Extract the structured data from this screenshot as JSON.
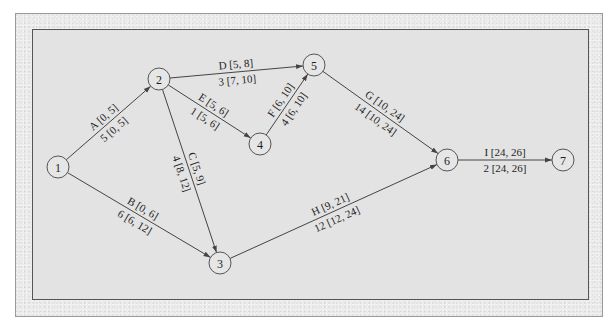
{
  "diagram": {
    "type": "project-network (activity-on-arc)",
    "colors": {
      "background": "#ffffff",
      "frame": "#ebebeb",
      "panel": "#e3e3e3",
      "line": "#444444",
      "text": "#1e1e1e"
    },
    "nodes": [
      {
        "id": "1",
        "label": "1",
        "x": 58,
        "y": 167
      },
      {
        "id": "2",
        "label": "2",
        "x": 159,
        "y": 79
      },
      {
        "id": "3",
        "label": "3",
        "x": 220,
        "y": 263
      },
      {
        "id": "4",
        "label": "4",
        "x": 260,
        "y": 144
      },
      {
        "id": "5",
        "label": "5",
        "x": 314,
        "y": 65
      },
      {
        "id": "6",
        "label": "6",
        "x": 447,
        "y": 160
      },
      {
        "id": "7",
        "label": "7",
        "x": 563,
        "y": 160
      }
    ],
    "edges": [
      {
        "activity": "A",
        "from": "1",
        "to": "2",
        "duration": "5",
        "top": "A  [0, 5]",
        "bottom": "5  [0, 5]"
      },
      {
        "activity": "B",
        "from": "1",
        "to": "3",
        "duration": "6",
        "top": "B  [0, 6]",
        "bottom": "6  [6, 12]"
      },
      {
        "activity": "C",
        "from": "2",
        "to": "3",
        "duration": "4",
        "top": "C  [5, 9]",
        "bottom": "4  [8, 12]"
      },
      {
        "activity": "D",
        "from": "2",
        "to": "5",
        "duration": "3",
        "top": "D  [5, 8]",
        "bottom": "3  [7, 10]"
      },
      {
        "activity": "E",
        "from": "2",
        "to": "4",
        "duration": "1",
        "top": "E  [5, 6]",
        "bottom": "1  [5, 6]"
      },
      {
        "activity": "F",
        "from": "4",
        "to": "5",
        "duration": "4",
        "top": "F  [6, 10]",
        "bottom": "4  [6, 10]"
      },
      {
        "activity": "G",
        "from": "5",
        "to": "6",
        "duration": "14",
        "top": "G  [10, 24]",
        "bottom": "14  [10, 24]"
      },
      {
        "activity": "H",
        "from": "3",
        "to": "6",
        "duration": "12",
        "top": "H  [9, 21]",
        "bottom": "12  [12, 24]"
      },
      {
        "activity": "I",
        "from": "6",
        "to": "7",
        "duration": "2",
        "top": "I  [24, 26]",
        "bottom": "2  [24, 26]"
      }
    ]
  }
}
